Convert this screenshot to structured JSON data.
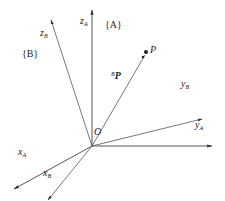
{
  "diagram": {
    "frame_A_label": "{A}",
    "frame_B_label": "{B}",
    "frame_A_letter": "A",
    "frame_B_letter": "B",
    "origin_label": "O",
    "point_label": "P",
    "vector_label": {
      "superscript": "B",
      "main": "P"
    },
    "axes": {
      "zA": {
        "base": "z",
        "sub": "A"
      },
      "yA": {
        "base": "y",
        "sub": "A"
      },
      "xA": {
        "base": "x",
        "sub": "A"
      },
      "zB": {
        "base": "z",
        "sub": "B"
      },
      "yB": {
        "base": "y",
        "sub": "B"
      },
      "xB": {
        "base": "x",
        "sub": "B"
      }
    },
    "colors": {
      "line": "#444444",
      "text": "#222222"
    }
  }
}
